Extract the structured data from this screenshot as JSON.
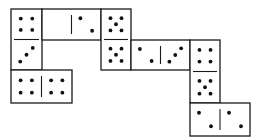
{
  "diagram": {
    "line_color": "#1a1a1a",
    "pip_color": "#111111",
    "background": "#ffffff",
    "dominoes": [
      {
        "id": "A",
        "orientation": "vertical",
        "x": 11,
        "y": 9,
        "w": 31,
        "h": 61,
        "halves": [
          4,
          3
        ]
      },
      {
        "id": "B",
        "orientation": "horizontal",
        "x": 42,
        "y": 9,
        "w": 59,
        "h": 31,
        "halves": [
          0,
          2
        ]
      },
      {
        "id": "C",
        "orientation": "vertical",
        "x": 101,
        "y": 9,
        "w": 30,
        "h": 61,
        "halves": [
          5,
          5
        ]
      },
      {
        "id": "D",
        "orientation": "horizontal",
        "x": 131,
        "y": 40,
        "w": 59,
        "h": 30,
        "halves": [
          2,
          3
        ]
      },
      {
        "id": "E",
        "orientation": "vertical",
        "x": 190,
        "y": 40,
        "w": 30,
        "h": 63,
        "halves": [
          4,
          5
        ]
      },
      {
        "id": "F",
        "orientation": "horizontal",
        "x": 11,
        "y": 70,
        "w": 61,
        "h": 33,
        "halves": [
          4,
          4
        ]
      },
      {
        "id": "G",
        "orientation": "horizontal",
        "x": 190,
        "y": 103,
        "w": 60,
        "h": 33,
        "halves": [
          2,
          2
        ]
      }
    ]
  }
}
